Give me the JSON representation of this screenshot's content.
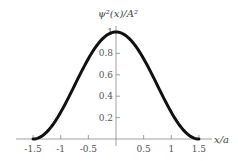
{
  "chart_data": {
    "type": "line",
    "title": "",
    "ylabel": "ψ²(x)/A²",
    "xlabel": "x/a",
    "xlim": [
      -1.5,
      1.5
    ],
    "ylim": [
      0,
      1
    ],
    "grid": false,
    "legend": null,
    "x_ticks": [
      "-1.5",
      "-1",
      "-0.5",
      "0.5",
      "1",
      "1.5"
    ],
    "y_ticks": [
      "0.2",
      "0.4",
      "0.6",
      "0.8",
      "1"
    ],
    "series": [
      {
        "name": "ψ²(x)/A²",
        "x": [
          -1.5,
          -1.25,
          -1.0,
          -0.75,
          -0.5,
          -0.25,
          0.0,
          0.25,
          0.5,
          0.75,
          1.0,
          1.25,
          1.5
        ],
        "y": [
          0.0,
          0.07,
          0.25,
          0.5,
          0.75,
          0.93,
          1.0,
          0.93,
          0.75,
          0.5,
          0.25,
          0.07,
          0.0
        ]
      }
    ]
  }
}
